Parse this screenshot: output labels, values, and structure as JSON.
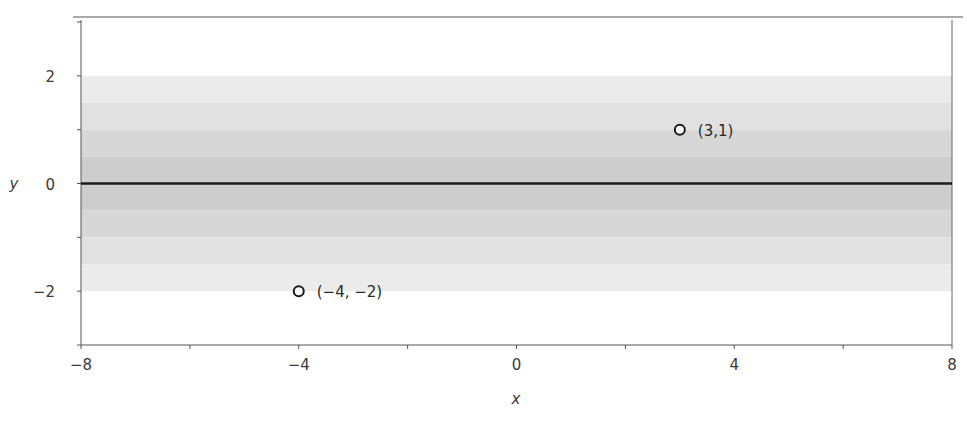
{
  "chart_data": {
    "type": "line",
    "title": "",
    "xlabel": "x",
    "ylabel": "y",
    "xlim": [
      -8,
      8
    ],
    "ylim": [
      -3,
      3
    ],
    "grid": false,
    "x_ticks": [
      -8,
      -6,
      -4,
      -2,
      0,
      2,
      4,
      6,
      8
    ],
    "x_tick_labels": [
      {
        "value": -8,
        "label": "−8"
      },
      {
        "value": -4,
        "label": "−4"
      },
      {
        "value": 0,
        "label": "0"
      },
      {
        "value": 4,
        "label": "4"
      },
      {
        "value": 8,
        "label": "8"
      }
    ],
    "y_ticks": [
      -3,
      -2,
      -1,
      0,
      1,
      2,
      3
    ],
    "y_tick_labels": [
      {
        "value": 2,
        "label": "2"
      },
      {
        "value": 0,
        "label": "0"
      },
      {
        "value": -2,
        "label": "−2"
      }
    ],
    "series": [
      {
        "name": "line y=0",
        "x": [
          -8,
          8
        ],
        "y": [
          0,
          0
        ],
        "color": "#1a1a1a"
      }
    ],
    "bands": [
      {
        "y0": 1.5,
        "y1": 2.0,
        "color": "#ebebeb"
      },
      {
        "y0": 1.0,
        "y1": 1.5,
        "color": "#e1e1e1"
      },
      {
        "y0": 0.5,
        "y1": 1.0,
        "color": "#d7d7d7"
      },
      {
        "y0": 0.0,
        "y1": 0.5,
        "color": "#cdcdcd"
      },
      {
        "y0": -0.5,
        "y1": 0.0,
        "color": "#cdcdcd"
      },
      {
        "y0": -1.0,
        "y1": -0.5,
        "color": "#d7d7d7"
      },
      {
        "y0": -1.5,
        "y1": -1.0,
        "color": "#e1e1e1"
      },
      {
        "y0": -2.0,
        "y1": -1.5,
        "color": "#ebebeb"
      }
    ],
    "points": [
      {
        "x": 3,
        "y": 1,
        "label": "(3,1)"
      },
      {
        "x": -4,
        "y": -2,
        "label": "(−4, −2)"
      }
    ],
    "legend": null
  }
}
